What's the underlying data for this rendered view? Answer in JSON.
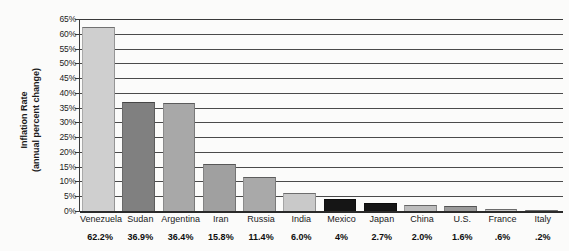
{
  "chart_data": {
    "type": "bar",
    "title": "",
    "subtitle": "",
    "xlabel": "",
    "ylabel_line1": "Inflation Rate",
    "ylabel_line2": "(annual percent change)",
    "ylim": [
      0,
      65
    ],
    "ytick_step": 5,
    "grid": true,
    "legend": "none",
    "ytick_labels": [
      "65%",
      "60%",
      "55%",
      "50%",
      "45%",
      "40%",
      "35%",
      "30%",
      "25%",
      "20%",
      "15%",
      "10%",
      "5%",
      "0%"
    ],
    "ytick_values": [
      65,
      60,
      55,
      50,
      45,
      40,
      35,
      30,
      25,
      20,
      15,
      10,
      5,
      0
    ],
    "categories": [
      "Venezuela",
      "Sudan",
      "Argentina",
      "Iran",
      "Russia",
      "India",
      "Mexico",
      "Japan",
      "China",
      "U.S.",
      "France",
      "Italy"
    ],
    "values": [
      62.2,
      36.9,
      36.4,
      15.8,
      11.4,
      6.0,
      4.0,
      2.7,
      2.0,
      1.6,
      0.6,
      0.2
    ],
    "value_labels": [
      "62.2%",
      "36.9%",
      "36.4%",
      "15.8%",
      "11.4%",
      "6.0%",
      "4%",
      "2.7%",
      "2.0%",
      "1.6%",
      ".6%",
      ".2%"
    ],
    "bar_colors": [
      "#cfcfcf",
      "#808080",
      "#a8a8a8",
      "#a0a0a0",
      "#a9a9a9",
      "#c9c9c9",
      "#151515",
      "#151515",
      "#bdbdbd",
      "#9a9a9a",
      "#c4c4c4",
      "#c4c4c4"
    ],
    "colors": {
      "background": "#fbfbfa",
      "gridline": "#4a4a4a",
      "axis": "#2a2a2a",
      "text": "#1a1a1a"
    }
  }
}
